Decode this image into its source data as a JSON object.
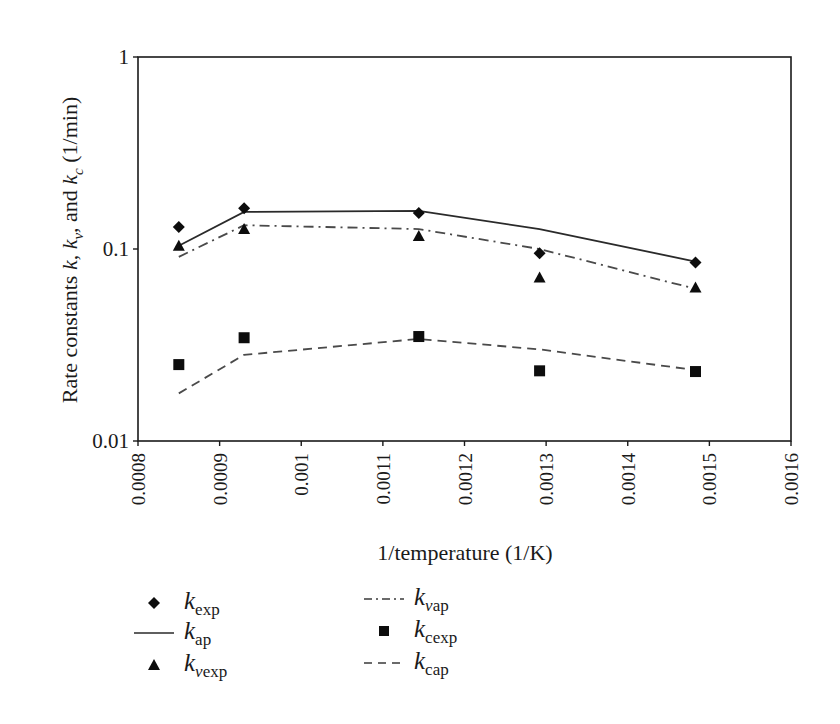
{
  "chart_data": {
    "type": "line",
    "title": "",
    "xlabel": "1/temperature (1/K)",
    "ylabel": "Rate constants k, kv, and kc (1/min)",
    "ylabel_parts": {
      "prefix": "Rate constants ",
      "k": "k",
      "sep1": ", ",
      "kv_base": "k",
      "kv_sub": "v",
      "sep2": ", and ",
      "kc_base": "k",
      "kc_sub": "c",
      "suffix": " (1/min)"
    },
    "xlim": [
      0.0008,
      0.0016
    ],
    "ylim": [
      0.01,
      1
    ],
    "yscale": "log",
    "grid": false,
    "xticks": [
      "0.0008",
      "0.0009",
      "0.001",
      "0.0011",
      "0.0012",
      "0.0013",
      "0.0014",
      "0.0015",
      "0.0016"
    ],
    "xtick_values": [
      0.0008,
      0.0009,
      0.001,
      0.0011,
      0.0012,
      0.0013,
      0.0014,
      0.0015,
      0.0016
    ],
    "yticks": [
      "0.01",
      "0.1",
      "1"
    ],
    "ytick_values": [
      0.01,
      0.1,
      1
    ],
    "x": [
      0.00085,
      0.00093,
      0.001144,
      0.001292,
      0.001483
    ],
    "series": [
      {
        "name": "k_exp",
        "label_base": "k",
        "label_sub": "exp",
        "label_sub_italic": "",
        "kind": "marker",
        "marker": "diamond",
        "values": [
          0.13,
          0.163,
          0.154,
          0.095,
          0.085
        ]
      },
      {
        "name": "k_ap",
        "label_base": "k",
        "label_sub": "ap",
        "label_sub_italic": "",
        "kind": "line",
        "dash": "solid",
        "values": [
          0.104,
          0.156,
          0.158,
          0.127,
          0.086
        ]
      },
      {
        "name": "k_vexp",
        "label_base": "k",
        "label_sub": "exp",
        "label_sub_italic": "v",
        "kind": "marker",
        "marker": "triangle",
        "values": [
          0.104,
          0.127,
          0.117,
          0.071,
          0.063
        ]
      },
      {
        "name": "k_vap",
        "label_base": "k",
        "label_sub": "ap",
        "label_sub_italic": "v",
        "kind": "line",
        "dash": "dashdot",
        "values": [
          0.091,
          0.133,
          0.127,
          0.1,
          0.062
        ]
      },
      {
        "name": "k_cexp",
        "label_base": "k",
        "label_sub": "cexp",
        "label_sub_italic": "",
        "kind": "marker",
        "marker": "square",
        "values": [
          0.025,
          0.0345,
          0.035,
          0.0232,
          0.023
        ]
      },
      {
        "name": "k_cap",
        "label_base": "k",
        "label_sub": "cap",
        "label_sub_italic": "",
        "kind": "line",
        "dash": "dashed",
        "values": [
          0.0177,
          0.0281,
          0.034,
          0.03,
          0.0234
        ]
      }
    ],
    "legend": {
      "position": "below",
      "columns": 2,
      "entries": [
        "k_exp",
        "k_ap",
        "k_vexp",
        "k_vap",
        "k_cexp",
        "k_cap"
      ]
    },
    "colors": {
      "axis": "#1a1a1a",
      "line": "#2a2a2a",
      "dashed_line": "#4a4a4a",
      "marker": "#0d0d0d",
      "background": "#ffffff"
    }
  }
}
